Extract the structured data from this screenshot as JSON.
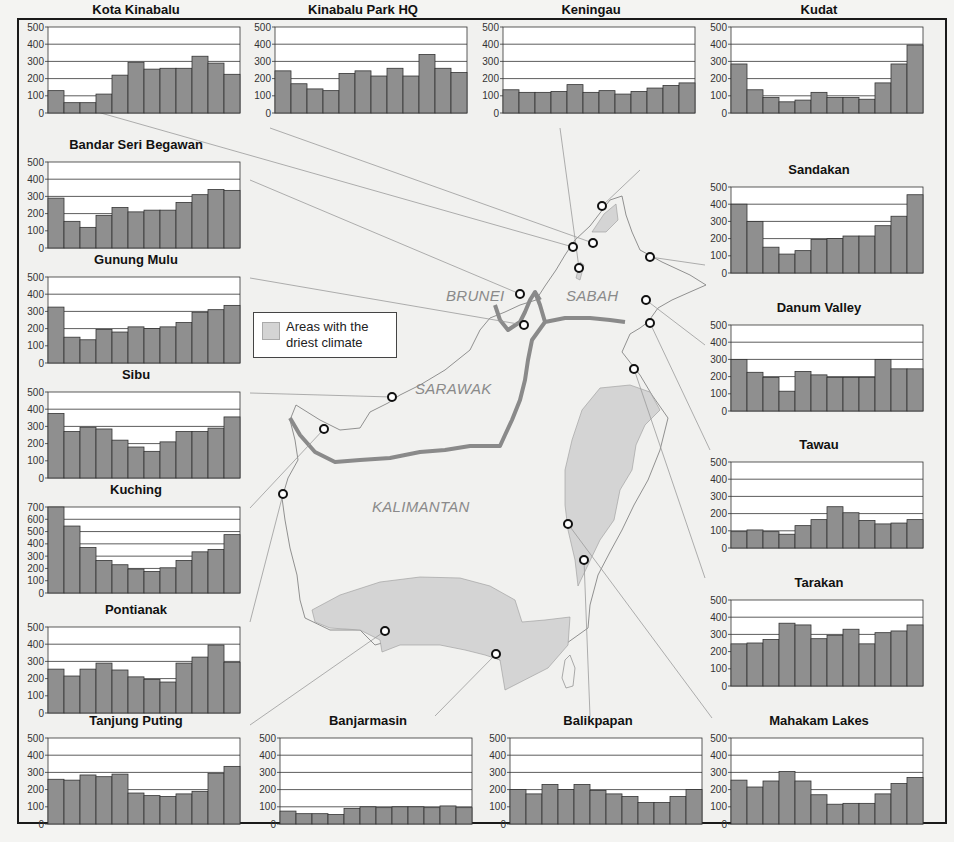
{
  "legend": {
    "label_line1": "Areas with the",
    "label_line2": "driest climate",
    "swatch_color": "#d4d4d4"
  },
  "regions": [
    {
      "label": "BRUNEI",
      "x": 446,
      "y": 287
    },
    {
      "label": "SABAH",
      "x": 566,
      "y": 287
    },
    {
      "label": "SARAWAK",
      "x": 415,
      "y": 380
    },
    {
      "label": "KALIMANTAN",
      "x": 372,
      "y": 498
    }
  ],
  "colors": {
    "bar_fill": "#8f8f8f",
    "bar_stroke": "#333333",
    "grid": "#333333",
    "plot_bg": "#ffffff",
    "border_line": "#8a8a8a",
    "dry_area": "#d4d4d4",
    "land": "#f1f1ef"
  },
  "chart_data": [
    {
      "type": "bar",
      "title": "Kota Kinabalu",
      "categories": [
        "Jan",
        "Feb",
        "Mar",
        "Apr",
        "May",
        "Jun",
        "Jul",
        "Aug",
        "Sep",
        "Oct",
        "Nov",
        "Dec"
      ],
      "values": [
        130,
        60,
        60,
        110,
        220,
        295,
        255,
        260,
        260,
        330,
        290,
        225
      ],
      "ylim": [
        0,
        500
      ],
      "yticks": [
        0,
        100,
        200,
        300,
        400,
        500
      ],
      "pos": {
        "x": 20,
        "y": 2
      }
    },
    {
      "type": "bar",
      "title": "Kinabalu Park HQ",
      "categories": [
        "Jan",
        "Feb",
        "Mar",
        "Apr",
        "May",
        "Jun",
        "Jul",
        "Aug",
        "Sep",
        "Oct",
        "Nov",
        "Dec"
      ],
      "values": [
        245,
        170,
        140,
        130,
        230,
        245,
        215,
        260,
        215,
        340,
        260,
        235
      ],
      "ylim": [
        0,
        500
      ],
      "yticks": [
        0,
        100,
        200,
        300,
        400,
        500
      ],
      "pos": {
        "x": 247,
        "y": 2
      }
    },
    {
      "type": "bar",
      "title": "Keningau",
      "categories": [
        "Jan",
        "Feb",
        "Mar",
        "Apr",
        "May",
        "Jun",
        "Jul",
        "Aug",
        "Sep",
        "Oct",
        "Nov",
        "Dec"
      ],
      "values": [
        135,
        120,
        120,
        125,
        165,
        120,
        130,
        110,
        125,
        145,
        160,
        175
      ],
      "ylim": [
        0,
        500
      ],
      "yticks": [
        0,
        100,
        200,
        300,
        400,
        500
      ],
      "pos": {
        "x": 475,
        "y": 2
      }
    },
    {
      "type": "bar",
      "title": "Kudat",
      "categories": [
        "Jan",
        "Feb",
        "Mar",
        "Apr",
        "May",
        "Jun",
        "Jul",
        "Aug",
        "Sep",
        "Oct",
        "Nov",
        "Dec"
      ],
      "values": [
        285,
        135,
        90,
        65,
        75,
        120,
        90,
        90,
        80,
        175,
        285,
        395
      ],
      "ylim": [
        0,
        500
      ],
      "yticks": [
        0,
        100,
        200,
        300,
        400,
        500
      ],
      "pos": {
        "x": 703,
        "y": 2
      }
    },
    {
      "type": "bar",
      "title": "Bandar Seri Begawan",
      "categories": [
        "Jan",
        "Feb",
        "Mar",
        "Apr",
        "May",
        "Jun",
        "Jul",
        "Aug",
        "Sep",
        "Oct",
        "Nov",
        "Dec"
      ],
      "values": [
        290,
        155,
        120,
        190,
        235,
        210,
        220,
        220,
        265,
        310,
        340,
        335
      ],
      "ylim": [
        0,
        500
      ],
      "yticks": [
        0,
        100,
        200,
        300,
        400,
        500
      ],
      "pos": {
        "x": 20,
        "y": 137
      }
    },
    {
      "type": "bar",
      "title": "Sandakan",
      "categories": [
        "Jan",
        "Feb",
        "Mar",
        "Apr",
        "May",
        "Jun",
        "Jul",
        "Aug",
        "Sep",
        "Oct",
        "Nov",
        "Dec"
      ],
      "values": [
        400,
        300,
        150,
        110,
        130,
        195,
        200,
        215,
        215,
        275,
        330,
        455
      ],
      "ylim": [
        0,
        500
      ],
      "yticks": [
        0,
        100,
        200,
        300,
        400,
        500
      ],
      "pos": {
        "x": 703,
        "y": 162
      }
    },
    {
      "type": "bar",
      "title": "Gunung Mulu",
      "categories": [
        "Jan",
        "Feb",
        "Mar",
        "Apr",
        "May",
        "Jun",
        "Jul",
        "Aug",
        "Sep",
        "Oct",
        "Nov",
        "Dec"
      ],
      "values": [
        325,
        150,
        135,
        195,
        180,
        210,
        200,
        210,
        235,
        295,
        310,
        335
      ],
      "ylim": [
        0,
        500
      ],
      "yticks": [
        0,
        100,
        200,
        300,
        400,
        500
      ],
      "pos": {
        "x": 20,
        "y": 252
      }
    },
    {
      "type": "bar",
      "title": "Danum Valley",
      "categories": [
        "Jan",
        "Feb",
        "Mar",
        "Apr",
        "May",
        "Jun",
        "Jul",
        "Aug",
        "Sep",
        "Oct",
        "Nov",
        "Dec"
      ],
      "values": [
        300,
        225,
        195,
        115,
        230,
        210,
        195,
        195,
        195,
        300,
        245,
        245
      ],
      "ylim": [
        0,
        500
      ],
      "yticks": [
        0,
        100,
        200,
        300,
        400,
        500
      ],
      "pos": {
        "x": 703,
        "y": 300
      }
    },
    {
      "type": "bar",
      "title": "Sibu",
      "categories": [
        "Jan",
        "Feb",
        "Mar",
        "Apr",
        "May",
        "Jun",
        "Jul",
        "Aug",
        "Sep",
        "Oct",
        "Nov",
        "Dec"
      ],
      "values": [
        375,
        270,
        295,
        285,
        220,
        180,
        155,
        210,
        270,
        270,
        290,
        355
      ],
      "ylim": [
        0,
        500
      ],
      "yticks": [
        0,
        100,
        200,
        300,
        400,
        500
      ],
      "pos": {
        "x": 20,
        "y": 367
      }
    },
    {
      "type": "bar",
      "title": "Tawau",
      "categories": [
        "Jan",
        "Feb",
        "Mar",
        "Apr",
        "May",
        "Jun",
        "Jul",
        "Aug",
        "Sep",
        "Oct",
        "Nov",
        "Dec"
      ],
      "values": [
        95,
        105,
        95,
        80,
        130,
        165,
        240,
        205,
        160,
        140,
        145,
        165
      ],
      "ylim": [
        0,
        500
      ],
      "yticks": [
        0,
        100,
        200,
        300,
        400,
        500
      ],
      "pos": {
        "x": 703,
        "y": 437
      }
    },
    {
      "type": "bar",
      "title": "Kuching",
      "categories": [
        "Jan",
        "Feb",
        "Mar",
        "Apr",
        "May",
        "Jun",
        "Jul",
        "Aug",
        "Sep",
        "Oct",
        "Nov",
        "Dec"
      ],
      "values": [
        700,
        545,
        370,
        265,
        230,
        195,
        175,
        205,
        265,
        335,
        355,
        475
      ],
      "ylim": [
        0,
        700
      ],
      "yticks": [
        0,
        100,
        200,
        300,
        400,
        500,
        600,
        700
      ],
      "pos": {
        "x": 20,
        "y": 482
      }
    },
    {
      "type": "bar",
      "title": "Tarakan",
      "categories": [
        "Jan",
        "Feb",
        "Mar",
        "Apr",
        "May",
        "Jun",
        "Jul",
        "Aug",
        "Sep",
        "Oct",
        "Nov",
        "Dec"
      ],
      "values": [
        245,
        250,
        270,
        365,
        355,
        275,
        295,
        330,
        245,
        310,
        320,
        355
      ],
      "ylim": [
        0,
        500
      ],
      "yticks": [
        0,
        100,
        200,
        300,
        400,
        500
      ],
      "pos": {
        "x": 703,
        "y": 575
      }
    },
    {
      "type": "bar",
      "title": "Pontianak",
      "categories": [
        "Jan",
        "Feb",
        "Mar",
        "Apr",
        "May",
        "Jun",
        "Jul",
        "Aug",
        "Sep",
        "Oct",
        "Nov",
        "Dec"
      ],
      "values": [
        255,
        215,
        255,
        290,
        250,
        210,
        195,
        180,
        290,
        325,
        395,
        295
      ],
      "ylim": [
        0,
        500
      ],
      "yticks": [
        0,
        100,
        200,
        300,
        400,
        500
      ],
      "pos": {
        "x": 20,
        "y": 602
      }
    },
    {
      "type": "bar",
      "title": "Tanjung Puting",
      "categories": [
        "Jan",
        "Feb",
        "Mar",
        "Apr",
        "May",
        "Jun",
        "Jul",
        "Aug",
        "Sep",
        "Oct",
        "Nov",
        "Dec"
      ],
      "values": [
        260,
        255,
        285,
        275,
        290,
        180,
        165,
        160,
        175,
        190,
        295,
        335
      ],
      "ylim": [
        0,
        500
      ],
      "yticks": [
        0,
        100,
        200,
        300,
        400,
        500
      ],
      "pos": {
        "x": 20,
        "y": 713
      }
    },
    {
      "type": "bar",
      "title": "Banjarmasin",
      "categories": [
        "Jan",
        "Feb",
        "Mar",
        "Apr",
        "May",
        "Jun",
        "Jul",
        "Aug",
        "Sep",
        "Oct",
        "Nov",
        "Dec"
      ],
      "values": [
        75,
        60,
        60,
        55,
        90,
        100,
        95,
        100,
        100,
        95,
        105,
        95
      ],
      "ylim": [
        0,
        500
      ],
      "yticks": [
        0,
        100,
        200,
        300,
        400,
        500
      ],
      "pos": {
        "x": 252,
        "y": 713
      }
    },
    {
      "type": "bar",
      "title": "Balikpapan",
      "categories": [
        "Jan",
        "Feb",
        "Mar",
        "Apr",
        "May",
        "Jun",
        "Jul",
        "Aug",
        "Sep",
        "Oct",
        "Nov",
        "Dec"
      ],
      "values": [
        200,
        175,
        230,
        200,
        230,
        195,
        175,
        160,
        125,
        125,
        160,
        200
      ],
      "ylim": [
        0,
        500
      ],
      "yticks": [
        0,
        100,
        200,
        300,
        400,
        500
      ],
      "pos": {
        "x": 482,
        "y": 713
      }
    },
    {
      "type": "bar",
      "title": "Mahakam Lakes",
      "categories": [
        "Jan",
        "Feb",
        "Mar",
        "Apr",
        "May",
        "Jun",
        "Jul",
        "Aug",
        "Sep",
        "Oct",
        "Nov",
        "Dec"
      ],
      "values": [
        255,
        215,
        250,
        305,
        250,
        170,
        115,
        120,
        120,
        175,
        235,
        270
      ],
      "ylim": [
        0,
        500
      ],
      "yticks": [
        0,
        100,
        200,
        300,
        400,
        500
      ],
      "pos": {
        "x": 703,
        "y": 713
      }
    }
  ],
  "stations": [
    {
      "name": "Kota Kinabalu",
      "x": 573,
      "y": 247,
      "chart": [
        48,
        98
      ]
    },
    {
      "name": "Kinabalu Park HQ",
      "x": 593,
      "y": 243,
      "chart": [
        270,
        128
      ]
    },
    {
      "name": "Keningau",
      "x": 579,
      "y": 268,
      "chart": [
        560,
        128
      ]
    },
    {
      "name": "Kudat",
      "x": 602,
      "y": 206,
      "chart": [
        640,
        170
      ]
    },
    {
      "name": "Bandar Seri Begawan",
      "x": 520,
      "y": 294,
      "chart": [
        250,
        180
      ]
    },
    {
      "name": "Sandakan",
      "x": 650,
      "y": 257,
      "chart": [
        705,
        265
      ]
    },
    {
      "name": "Gunung Mulu",
      "x": 524,
      "y": 325,
      "chart": [
        250,
        278
      ]
    },
    {
      "name": "Danum Valley",
      "x": 646,
      "y": 300,
      "chart": [
        705,
        345
      ]
    },
    {
      "name": "Lahad Datu",
      "x": 650,
      "y": 323,
      "chart": [
        710,
        450
      ]
    },
    {
      "name": "Sibu",
      "x": 392,
      "y": 397,
      "chart": [
        250,
        393
      ]
    },
    {
      "name": "Kuching",
      "x": 324,
      "y": 429,
      "chart": [
        250,
        508
      ]
    },
    {
      "name": "Pontianak",
      "x": 283,
      "y": 494,
      "chart": [
        250,
        622
      ]
    },
    {
      "name": "Tarakan",
      "x": 634,
      "y": 369,
      "chart": [
        705,
        578
      ]
    },
    {
      "name": "Mahakam Lakes",
      "x": 568,
      "y": 524,
      "chart": [
        712,
        718
      ]
    },
    {
      "name": "Balikpapan",
      "x": 584,
      "y": 560,
      "chart": [
        590,
        716
      ]
    },
    {
      "name": "Tanjung Puting",
      "x": 385,
      "y": 631,
      "chart": [
        250,
        725
      ]
    },
    {
      "name": "Banjarmasin",
      "x": 496,
      "y": 654,
      "chart": [
        435,
        716
      ]
    }
  ]
}
